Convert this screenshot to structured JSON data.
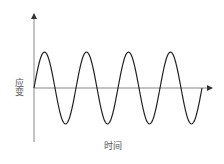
{
  "chart_data": {
    "type": "line",
    "title": "",
    "xlabel": "时间",
    "ylabel": "应变",
    "grid": false,
    "legend": null,
    "ticks": "none",
    "function": "sine",
    "cycles": 4,
    "amplitude_relative": 1,
    "x": [
      0,
      0.25,
      0.5,
      0.75,
      1,
      1.25,
      1.5,
      1.75,
      2,
      2.25,
      2.5,
      2.75,
      3,
      3.25,
      3.5,
      3.75,
      4
    ],
    "values": [
      0,
      1,
      0,
      -1,
      0,
      1,
      0,
      -1,
      0,
      1,
      0,
      -1,
      0,
      1,
      0,
      -1,
      0
    ],
    "colors": {
      "wave": "#222222",
      "axes": "#888888"
    }
  }
}
